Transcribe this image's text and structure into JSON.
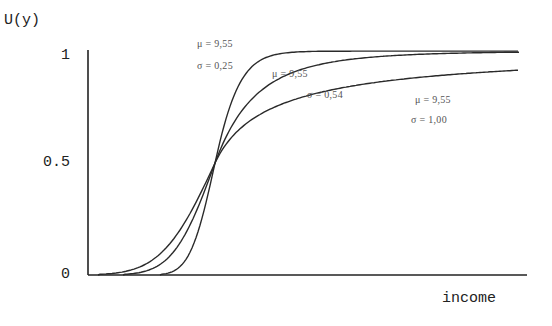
{
  "chart_data": {
    "type": "line",
    "title": "",
    "xlabel": "income",
    "ylabel": "U(y)",
    "yticks": [
      "1",
      "0.5",
      "0"
    ],
    "ylim": [
      0,
      1
    ],
    "grid": false,
    "legend": "inline annotations",
    "series": [
      {
        "name": "mu = 9.55, sigma = 0.25",
        "mu": "9,55",
        "sigma": "0,25",
        "mu_value": 9.55,
        "sigma_value": 0.25,
        "annotation": {
          "mu_text": "μ = 9,55",
          "sigma_text": "σ = 0,25"
        }
      },
      {
        "name": "mu = 9.55, sigma = 0.54",
        "mu": "9,55",
        "sigma": "0,54",
        "mu_value": 9.55,
        "sigma_value": 0.54,
        "annotation": {
          "mu_text": "μ = 9,55",
          "sigma_text": "σ = 0,54"
        }
      },
      {
        "name": "mu = 9.55, sigma = 1.00",
        "mu": "9,55",
        "sigma": "1,00",
        "mu_value": 9.55,
        "sigma_value": 1.0,
        "annotation": {
          "mu_text": "μ = 9,55",
          "sigma_text": "σ = 1,00"
        }
      }
    ]
  },
  "labels": {
    "ylabel": "U(y)",
    "xlabel": "income",
    "ytick_1": "1",
    "ytick_05": "0.5",
    "ytick_0": "0"
  },
  "colors": {
    "axis": "#222222",
    "curve": "#2a2a2a",
    "text": "#222222"
  }
}
